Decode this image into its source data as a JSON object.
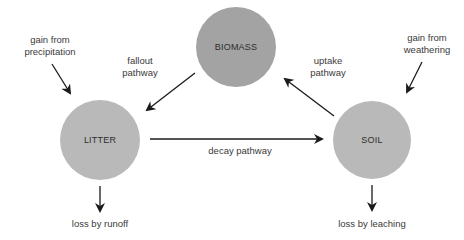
{
  "colors": {
    "biomass_fill": "#a3a3a3",
    "litter_fill": "#b9b9b9",
    "soil_fill": "#b9b9b9",
    "arrow": "#1a1a1a"
  },
  "nodes": {
    "biomass": {
      "label": "BIOMASS"
    },
    "litter": {
      "label": "LITTER"
    },
    "soil": {
      "label": "SOIL"
    }
  },
  "pathways": {
    "fallout": {
      "line1": "fallout",
      "line2": "pathway"
    },
    "uptake": {
      "line1": "uptake",
      "line2": "pathway"
    },
    "decay": {
      "label": "decay pathway"
    }
  },
  "inputs": {
    "precipitation": {
      "line1": "gain from",
      "line2": "precipitation"
    },
    "weathering": {
      "line1": "gain from",
      "line2": "weathering"
    }
  },
  "outputs": {
    "runoff": {
      "label": "loss by runoff"
    },
    "leaching": {
      "label": "loss by leaching"
    }
  }
}
